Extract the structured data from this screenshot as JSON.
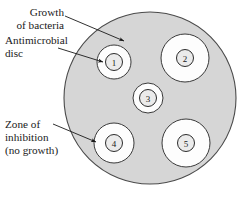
{
  "figure": {
    "colors": {
      "agar_fill": "#d6d6d6",
      "agar_stroke": "#4a4a4a",
      "zone_fill": "#fefefe",
      "zone_stroke": "#3a3a3a",
      "disc_fill": "#ebebeb",
      "disc_stroke": "#2b2b2b",
      "line": "#1a1a1a",
      "text": "#1a1a1a",
      "background": "#ffffff"
    },
    "plate": {
      "cx": 150,
      "cy": 98,
      "r": 86
    }
  },
  "labels": [
    {
      "id": "growth-of-bacteria",
      "lines": [
        "Growth",
        "of bacteria"
      ],
      "line1": "Growth",
      "line2": "of bacteria",
      "x": 63,
      "y": 12,
      "align": "end",
      "leader": {
        "x1": 65,
        "y1": 16,
        "x2": 124,
        "y2": 40
      }
    },
    {
      "id": "antimicrobial-disc",
      "lines": [
        "Antimicrobial",
        "disc"
      ],
      "line1": "Antimicrobial",
      "line2": "disc",
      "x": 6,
      "y": 35,
      "align": "start",
      "leader": {
        "x1": 58,
        "y1": 48,
        "x2": 104,
        "y2": 62
      }
    },
    {
      "id": "zone-of-inhibition",
      "lines": [
        "Zone of",
        "inhibition",
        "(no growth)"
      ],
      "line1": "Zone of",
      "line2": "inhibition",
      "line3": "(no growth)",
      "x": 6,
      "y": 123,
      "align": "start",
      "leader": {
        "x1": 55,
        "y1": 124,
        "x2": 95,
        "y2": 142
      }
    }
  ],
  "discs": [
    {
      "id": "disc-1",
      "number": "1",
      "cx": 114,
      "cy": 62,
      "zone_r": 17,
      "disc_r": 8.5
    },
    {
      "id": "disc-2",
      "number": "2",
      "cx": 185,
      "cy": 58,
      "zone_r": 24,
      "disc_r": 8.5
    },
    {
      "id": "disc-3",
      "number": "3",
      "cx": 148,
      "cy": 98,
      "zone_r": 15,
      "disc_r": 8.5
    },
    {
      "id": "disc-4",
      "number": "4",
      "cx": 114,
      "cy": 143,
      "zone_r": 20,
      "disc_r": 8.5
    },
    {
      "id": "disc-5",
      "number": "5",
      "cx": 186,
      "cy": 143,
      "zone_r": 24,
      "disc_r": 8.5
    }
  ]
}
